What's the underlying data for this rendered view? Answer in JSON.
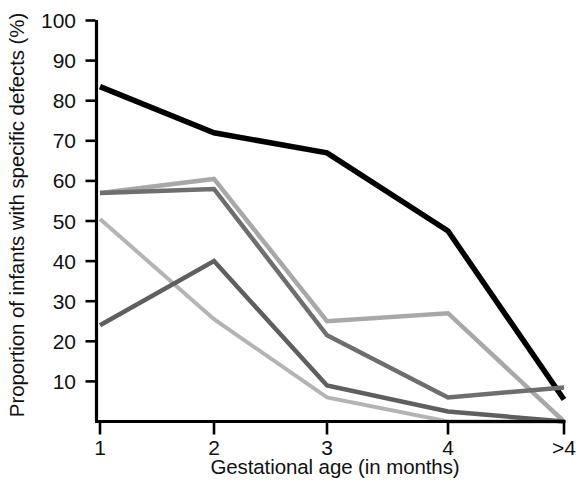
{
  "chart_data": {
    "type": "line",
    "title": "",
    "subtitle": "",
    "xlabel": "Gestational age (in months)",
    "ylabel": "Proportion of infants with specific defects (%)",
    "x": [
      "1",
      "2",
      "3",
      "4",
      ">4"
    ],
    "categories": [
      "1",
      "2",
      "3",
      "4",
      ">4"
    ],
    "xtick_labels": [
      "1",
      "2",
      "3",
      "4",
      ">4"
    ],
    "ytick_labels": [
      "10",
      "20",
      "30",
      "40",
      "50",
      "60",
      "70",
      "80",
      "90",
      "100"
    ],
    "ytick_values": [
      10,
      20,
      30,
      40,
      50,
      60,
      70,
      80,
      90,
      100
    ],
    "ylim": [
      0,
      100
    ],
    "xlim": [
      0,
      4
    ],
    "grid": false,
    "legend": "none",
    "series": [
      {
        "name": "series-1-black",
        "color": "#000000",
        "width": 5.5,
        "values": [
          83.5,
          72,
          67,
          47.5,
          5.5
        ]
      },
      {
        "name": "series-2-light-gray",
        "color": "#a8a8a8",
        "width": 4.5,
        "values": [
          57,
          60.5,
          25,
          27,
          0
        ]
      },
      {
        "name": "series-3-dark-gray",
        "color": "#6e6e6e",
        "width": 4.5,
        "values": [
          57,
          58,
          21.5,
          6,
          8.5
        ]
      },
      {
        "name": "series-4-medium-gray",
        "color": "#b4b4b4",
        "width": 4.0,
        "values": [
          50.5,
          25.5,
          6,
          0,
          0
        ]
      },
      {
        "name": "series-5-slate-gray",
        "color": "#5f5f5f",
        "width": 4.5,
        "values": [
          24,
          40,
          9,
          2.5,
          0
        ]
      }
    ],
    "axis_color": "#000000"
  }
}
